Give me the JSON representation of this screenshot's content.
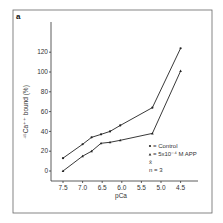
{
  "panel_label": "a",
  "chart_data": {
    "type": "line",
    "title": "",
    "xlabel": "pCa",
    "ylabel": "⁴⁵Ca⁺⁺ bound (%)",
    "xlim": [
      7.7,
      4.2
    ],
    "ylim": [
      -8,
      140
    ],
    "x_ticks": [
      7.5,
      7.0,
      6.5,
      6.0,
      5.5,
      5.0,
      4.5
    ],
    "x_tick_labels": [
      "7.5",
      "7.0",
      "6.5",
      "6.0",
      "5.5",
      "5.0",
      "4.5"
    ],
    "y_ticks": [
      0,
      20,
      40,
      60,
      80,
      100,
      120
    ],
    "y_tick_labels": [
      "0",
      "20",
      "40",
      "60",
      "80",
      "100",
      "120"
    ],
    "grid": false,
    "legend_position": "bottom-right",
    "series": [
      {
        "name": "Control",
        "marker": "circle",
        "x": [
          7.5,
          7.0,
          6.77,
          6.53,
          6.3,
          6.04,
          5.22,
          4.5
        ],
        "y": [
          13,
          27,
          34,
          37,
          40,
          46,
          64,
          124
        ]
      },
      {
        "name": "5x10⁻⁴ M APP",
        "marker": "triangle",
        "x": [
          7.5,
          7.0,
          6.77,
          6.53,
          6.3,
          6.04,
          5.22,
          4.5
        ],
        "y": [
          0,
          15,
          20,
          28,
          29,
          31,
          38,
          101
        ]
      }
    ],
    "legend": {
      "entries": [
        "= Control",
        "= 5x10⁻⁴ M APP"
      ],
      "extra_lines": [
        "x̄",
        "n = 3"
      ]
    }
  }
}
